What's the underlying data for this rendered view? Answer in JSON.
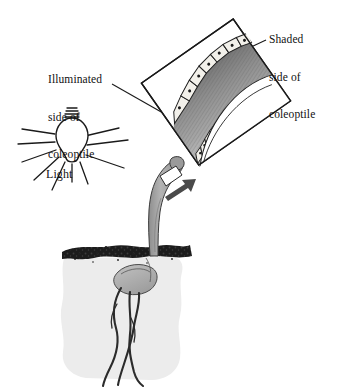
{
  "figure": {
    "type": "biology-diagram",
    "background_color": "#ffffff",
    "width": 339,
    "height": 392
  },
  "labels": {
    "shaded": {
      "name": "shaded-side-label",
      "lines": [
        "Shaded",
        "side of",
        "coleoptile"
      ],
      "line1": "Shaded",
      "line2": "side of",
      "line3": "coleoptile"
    },
    "illuminated": {
      "name": "illuminated-side-label",
      "lines": [
        "Illuminated",
        "side of",
        "coleoptile"
      ],
      "line1": "Illuminated",
      "line2": "side of",
      "line3": "coleoptile"
    },
    "light": {
      "name": "light-label",
      "text": "Light"
    }
  },
  "elements": {
    "light_bulb": {
      "name": "light-bulb-icon",
      "description": "incandescent bulb with screw base emitting rays",
      "ray_count": 9,
      "glass_color": "#ffffff",
      "outline_color": "#1a1a1a"
    },
    "coleoptile": {
      "name": "coleoptile-shoot",
      "description": "grass seedling shoot bending toward the light",
      "fill_color": "#a8a8a8",
      "tip_band_color": "#ffffff",
      "bend_direction": "toward-light-left"
    },
    "soil": {
      "name": "soil-cross-section",
      "surface_color": "#1c1c1c",
      "body_color": "#ececec",
      "description": "speckled dark soil surface over a pale soil block"
    },
    "seed": {
      "name": "seed-grain",
      "fill_color": "#b5b5b5",
      "description": "germinating grain with emerging roots"
    },
    "roots": {
      "name": "root-system",
      "count": 3,
      "color": "#2b2b2b"
    },
    "magnify_arrow": {
      "name": "magnify-arrow-icon",
      "direction": "up-right",
      "color": "#4a4a4a"
    },
    "magnified_panel": {
      "name": "magnified-coleoptile-panel",
      "rotation_deg": -35,
      "border_color": "#1a1a1a",
      "tissue_color": "#8f8f8f",
      "description": "rotated rectangular inset showing the coleoptile wall in section",
      "shaded_cells": {
        "name": "shaded-side-cells",
        "count": 9,
        "shape": "elongated-rectangular",
        "note": "cells elongated on the shaded side"
      },
      "illuminated_cells": {
        "name": "illuminated-side-cells",
        "count": 14,
        "shape": "small-rounded",
        "note": "cells shorter on the illuminated side"
      }
    },
    "leader_lines": {
      "name": "leader-lines",
      "count": 2,
      "color": "#1a1a1a"
    }
  }
}
